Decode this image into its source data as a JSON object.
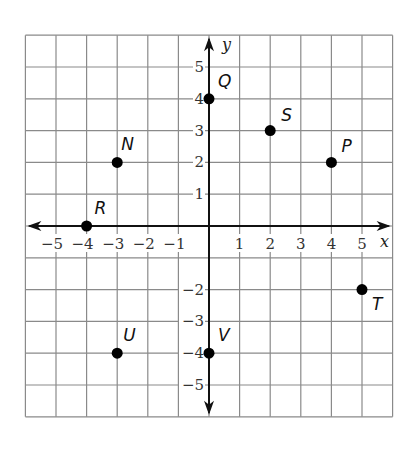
{
  "graph": {
    "x_axis_label": "x",
    "y_axis_label": "y",
    "x_ticks": [
      {
        "value": -5,
        "label": "−5"
      },
      {
        "value": -4,
        "label": "−4"
      },
      {
        "value": -3,
        "label": "−3"
      },
      {
        "value": -2,
        "label": "−2"
      },
      {
        "value": -1,
        "label": "−1"
      },
      {
        "value": 1,
        "label": "1"
      },
      {
        "value": 2,
        "label": "2"
      },
      {
        "value": 3,
        "label": "3"
      },
      {
        "value": 4,
        "label": "4"
      },
      {
        "value": 5,
        "label": "5"
      }
    ],
    "y_ticks": [
      {
        "value": 5,
        "label": "5"
      },
      {
        "value": 4,
        "label": "4"
      },
      {
        "value": 3,
        "label": "3"
      },
      {
        "value": 2,
        "label": "2"
      },
      {
        "value": 1,
        "label": "1"
      },
      {
        "value": -2,
        "label": "−2"
      },
      {
        "value": -3,
        "label": "−3"
      },
      {
        "value": -4,
        "label": "−4"
      },
      {
        "value": -5,
        "label": "−5"
      }
    ],
    "grid_range": {
      "x": [
        -6,
        6
      ],
      "y": [
        -6,
        6
      ]
    },
    "points": [
      {
        "name": "Q",
        "x": 0,
        "y": 4
      },
      {
        "name": "S",
        "x": 2,
        "y": 3
      },
      {
        "name": "N",
        "x": -3,
        "y": 2
      },
      {
        "name": "P",
        "x": 4,
        "y": 2
      },
      {
        "name": "R",
        "x": -4,
        "y": 0
      },
      {
        "name": "T",
        "x": 5,
        "y": -2
      },
      {
        "name": "U",
        "x": -3,
        "y": -4
      },
      {
        "name": "V",
        "x": 0,
        "y": -4
      }
    ],
    "colors": {
      "grid": "#8a8a8a",
      "axis": "#111111",
      "point": "#000000"
    }
  }
}
